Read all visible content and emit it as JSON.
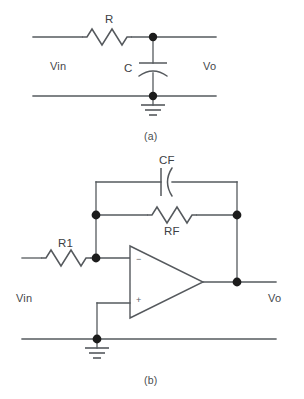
{
  "figure": {
    "background_color": "#ffffff",
    "line_color": "#55595d",
    "node_color": "#1c1c1c"
  },
  "circuit_a": {
    "caption": "(a)",
    "input_label": "Vin",
    "output_label": "Vo",
    "components": [
      {
        "id": "R",
        "label": "R",
        "type": "resistor"
      },
      {
        "id": "C",
        "label": "C",
        "type": "capacitor"
      }
    ],
    "ground_label": "",
    "nodes": 2
  },
  "circuit_b": {
    "caption": "(b)",
    "input_label": "Vin",
    "output_label": "Vo",
    "components": [
      {
        "id": "CF",
        "label": "CF",
        "type": "capacitor"
      },
      {
        "id": "RF",
        "label": "RF",
        "type": "resistor"
      },
      {
        "id": "R1",
        "label": "R1",
        "type": "resistor"
      },
      {
        "id": "U1",
        "label": "",
        "type": "op-amp"
      }
    ],
    "opamp": {
      "inverting_input_sign": "−",
      "noninverting_input_sign": "+"
    },
    "nodes": 4
  }
}
